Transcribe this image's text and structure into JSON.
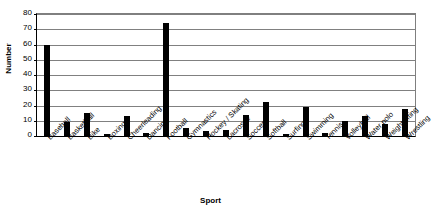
{
  "chart_data": {
    "type": "bar",
    "title": "",
    "xlabel": "Sport",
    "ylabel": "Number",
    "ylim": [
      0,
      80
    ],
    "ytick_step": 10,
    "yticks": [
      80,
      70,
      60,
      50,
      40,
      30,
      20,
      10,
      0
    ],
    "grid": true,
    "legend": false,
    "legend_position": "none",
    "bar_color": "#000000",
    "gridline_color": "#808080",
    "axis_color": "#000000",
    "categories": [
      "Baseball",
      "Basketball",
      "Bike",
      "Boxing",
      "Cheerleading",
      "Dancing",
      "Football",
      "Gymnastics",
      "Hockey / Skating",
      "Lacrosse",
      "Soccer",
      "Softball",
      "Surfing",
      "Swimming",
      "Tennis",
      "Volleyball",
      "Water polo",
      "Weight lifting",
      "Wrestling"
    ],
    "values": [
      60,
      9,
      15,
      1,
      13,
      2,
      74,
      5,
      3,
      4,
      14,
      22,
      1,
      19,
      2,
      10,
      13,
      8,
      18
    ]
  }
}
